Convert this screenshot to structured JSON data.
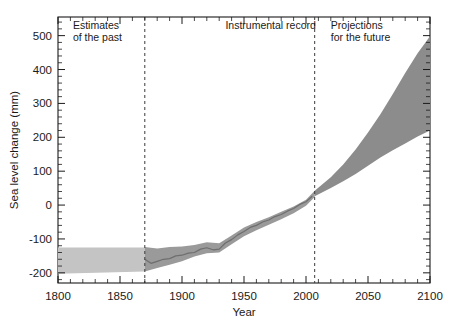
{
  "chart_data": {
    "type": "area",
    "title": "",
    "xlabel": "Year",
    "ylabel": "Sea level change (mm)",
    "xlim": [
      1800,
      2100
    ],
    "ylim": [
      -230,
      555
    ],
    "xticks": [
      1800,
      1850,
      1900,
      1950,
      2000,
      2050,
      2100
    ],
    "yticks": [
      500,
      400,
      300,
      200,
      100,
      0,
      -100,
      -200
    ],
    "xtick_labels": [
      "1800",
      "1850",
      "1900",
      "1950",
      "2000",
      "2050",
      "2100"
    ],
    "ytick_labels": [
      "500",
      "400",
      "300",
      "200",
      "100",
      "0",
      "-100",
      "-200"
    ],
    "grid": false,
    "legend": "none",
    "minor_tick_step_x": 10,
    "minor_tick_step_y": 20,
    "colors": {
      "past_band": "#c4c4c4",
      "instrumental_band": "#9a9a9a",
      "instrumental_line": "#6e6e6e",
      "projection_wedge": "#8c8c8c",
      "axis": "#1a1a1a",
      "divider": "#3a3a3a",
      "background": "#ffffff"
    },
    "annotations": [
      {
        "name": "estimates-of-the-past",
        "lines": [
          "Estimates",
          "of the past"
        ],
        "x": 1812,
        "y": 520
      },
      {
        "name": "instrumental-record",
        "lines": [
          "Instrumental record"
        ],
        "x": 1935,
        "y": 520
      },
      {
        "name": "projections-for-the-future",
        "lines": [
          "Projections",
          "for the future"
        ],
        "x": 2020,
        "y": 520
      }
    ],
    "dividers": [
      {
        "name": "divider-1870",
        "x": 1870
      },
      {
        "name": "divider-2007",
        "x": 2007
      }
    ],
    "series": [
      {
        "name": "Estimates of the past",
        "kind": "band",
        "x": [
          1800,
          1870
        ],
        "upper": [
          -125,
          -125
        ],
        "lower": [
          -203,
          -196
        ]
      },
      {
        "name": "Instrumental record",
        "kind": "band",
        "x": [
          1870,
          1880,
          1890,
          1900,
          1910,
          1920,
          1930,
          1940,
          1950,
          1960,
          1970,
          1980,
          1990,
          2000,
          2007
        ],
        "upper": [
          -124,
          -128,
          -124,
          -122,
          -118,
          -110,
          -113,
          -90,
          -66,
          -50,
          -36,
          -20,
          -4,
          16,
          42
        ],
        "lower": [
          -196,
          -186,
          -176,
          -166,
          -152,
          -142,
          -140,
          -116,
          -92,
          -74,
          -58,
          -42,
          -24,
          -2,
          24
        ]
      },
      {
        "name": "Instrumental record central estimate",
        "kind": "line",
        "x": [
          1870,
          1875,
          1880,
          1885,
          1890,
          1895,
          1900,
          1905,
          1910,
          1915,
          1920,
          1925,
          1930,
          1935,
          1940,
          1945,
          1950,
          1955,
          1960,
          1965,
          1970,
          1975,
          1980,
          1985,
          1990,
          1995,
          2000,
          2005
        ],
        "y": [
          -160,
          -172,
          -166,
          -160,
          -158,
          -150,
          -148,
          -142,
          -140,
          -130,
          -126,
          -132,
          -130,
          -112,
          -102,
          -88,
          -78,
          -66,
          -60,
          -50,
          -44,
          -34,
          -28,
          -18,
          -10,
          2,
          10,
          26
        ]
      },
      {
        "name": "Projections for the future",
        "kind": "band",
        "x": [
          2007,
          2020,
          2030,
          2040,
          2050,
          2060,
          2070,
          2080,
          2090,
          2100
        ],
        "upper": [
          42,
          82,
          120,
          164,
          214,
          268,
          328,
          390,
          448,
          498
        ],
        "lower": [
          26,
          50,
          70,
          92,
          116,
          140,
          162,
          182,
          202,
          220
        ]
      }
    ]
  }
}
